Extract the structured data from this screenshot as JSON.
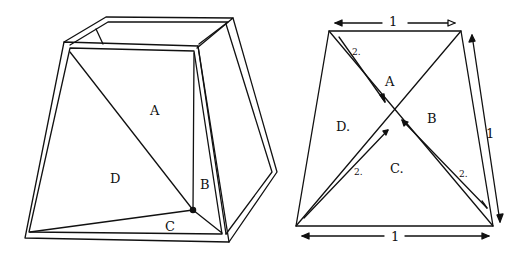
{
  "left_figure": {
    "labels": {
      "A": "A",
      "B": "B",
      "C": "C",
      "D": "D"
    }
  },
  "right_figure": {
    "labels": {
      "A": "A",
      "B": "B",
      "C": "C.",
      "D": "D."
    },
    "dimensions": {
      "top": "1",
      "bottom": "1",
      "right": "1",
      "diag_upper_left": "2.",
      "diag_lower_left": "2.",
      "diag_lower_right": "2."
    }
  },
  "colors": {
    "ink": "#111111",
    "background": "#ffffff"
  }
}
